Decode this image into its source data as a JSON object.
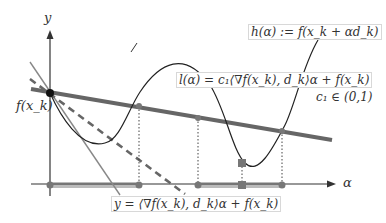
{
  "diagram": {
    "axis_y_label": "y",
    "axis_x_label": "α",
    "fxk_label": "f(x_k)",
    "h_label": "h(α) := f(x_k + αd_k)",
    "l_label": "l(α) = c₁⟨∇f(x_k), d_k⟩α + f(x_k)",
    "c1_label": "c₁ ∈ (0,1)",
    "tangent_label": "y = ⟨∇f(x_k), d_k⟩α + f(x_k)",
    "colors": {
      "axis": "#333333",
      "curve": "#222222",
      "l_line": "#666666",
      "tangent": "#888888",
      "dashed": "#666666",
      "interval": "#bbbbbb",
      "marker": "#777777"
    }
  }
}
